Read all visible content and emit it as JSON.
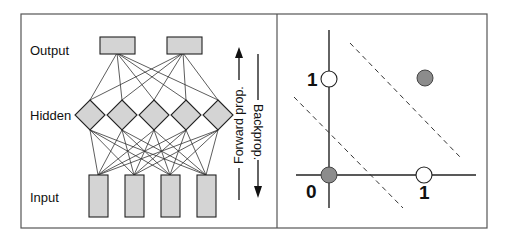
{
  "network": {
    "layer_labels": {
      "output": "Output",
      "hidden": "Hidden",
      "input": "Input"
    },
    "counts": {
      "output": 2,
      "hidden": 5,
      "input": 4
    },
    "node_fill": "#d4d4d4",
    "arrows": {
      "forward": "Forward prop.",
      "backward": "Backprop."
    }
  },
  "plot": {
    "axis_labels": {
      "x_one": "1",
      "origin": "0",
      "y_one": "1"
    },
    "points": [
      {
        "x": 0,
        "y": 0,
        "class": "gray"
      },
      {
        "x": 1,
        "y": 0,
        "class": "white"
      },
      {
        "x": 0,
        "y": 1,
        "class": "white"
      },
      {
        "x": 1,
        "y": 1,
        "class": "gray"
      }
    ],
    "colors": {
      "gray": "#8c8c8c",
      "white": "#ffffff"
    },
    "boundaries": "two dashed parallel lines separating classes"
  }
}
